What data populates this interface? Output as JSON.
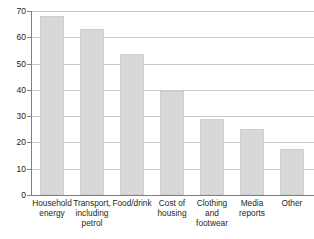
{
  "chart_data": {
    "type": "bar",
    "title": "",
    "subtitle": "",
    "xlabel": "",
    "ylabel": "",
    "ylim": [
      0,
      70
    ],
    "yticks": [
      0,
      10,
      20,
      30,
      40,
      50,
      60,
      70
    ],
    "ytick_labels": [
      "0",
      "10",
      "20",
      "30",
      "40",
      "50",
      "60",
      "70"
    ],
    "grid": "horizontal",
    "legend": "none",
    "categories": [
      "Household\nenergy",
      "Transport,\nincluding\npetrol",
      "Food/drink",
      "Cost of\nhousing",
      "Clothing\nand\nfootwear",
      "Media\nreports",
      "Other"
    ],
    "values": [
      68,
      63,
      53.5,
      39.5,
      29,
      25,
      17.5
    ],
    "series": [
      {
        "name": "",
        "values": [
          68,
          63,
          53.5,
          39.5,
          29,
          25,
          17.5
        ]
      }
    ],
    "colors": {
      "bar_fill": "#d8d8d8",
      "bar_stroke": "#cfcfcf",
      "gridline": "#c8c8c8",
      "axis": "#808080",
      "text": "#231f20",
      "background": "#ffffff"
    }
  }
}
